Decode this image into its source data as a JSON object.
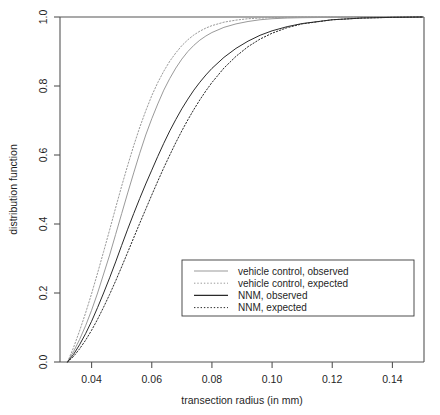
{
  "chart_data": {
    "type": "line",
    "title": "",
    "xlabel": "transection radius (in mm)",
    "ylabel": "distribution function",
    "xlim": [
      0.0295,
      0.1505
    ],
    "ylim": [
      0.0,
      1.0
    ],
    "xticks": [
      0.04,
      0.06,
      0.08,
      0.1,
      0.12,
      0.14
    ],
    "xtick_labels": [
      "0.04",
      "0.06",
      "0.08",
      "0.10",
      "0.12",
      "0.14"
    ],
    "yticks": [
      0.0,
      0.2,
      0.4,
      0.6,
      0.8,
      1.0
    ],
    "ytick_labels": [
      "0.0",
      "0.2",
      "0.4",
      "0.6",
      "0.8",
      "1.0"
    ],
    "grid": false,
    "legend_position": "center-right-lower",
    "colors": {
      "vehicle_control": "#9a9a9a",
      "nnm": "#2a2a2a"
    },
    "series": [
      {
        "name": "vehicle control, observed",
        "color": "#9a9a9a",
        "linestyle": "solid",
        "x": [
          0.032,
          0.034,
          0.036,
          0.038,
          0.04,
          0.042,
          0.044,
          0.046,
          0.048,
          0.05,
          0.052,
          0.054,
          0.056,
          0.058,
          0.06,
          0.062,
          0.064,
          0.066,
          0.068,
          0.07,
          0.072,
          0.074,
          0.076,
          0.078,
          0.08,
          0.084,
          0.088,
          0.092,
          0.096,
          0.1,
          0.105,
          0.11,
          0.12,
          0.13,
          0.14,
          0.15
        ],
        "y": [
          0.0,
          0.03,
          0.065,
          0.105,
          0.15,
          0.2,
          0.255,
          0.31,
          0.37,
          0.43,
          0.49,
          0.548,
          0.605,
          0.658,
          0.705,
          0.748,
          0.788,
          0.822,
          0.852,
          0.878,
          0.9,
          0.918,
          0.933,
          0.945,
          0.955,
          0.97,
          0.98,
          0.987,
          0.992,
          0.995,
          0.997,
          0.998,
          0.999,
          1.0,
          1.0,
          1.0
        ]
      },
      {
        "name": "vehicle control, expected",
        "color": "#9a9a9a",
        "linestyle": "dotted",
        "x": [
          0.032,
          0.034,
          0.036,
          0.038,
          0.04,
          0.042,
          0.044,
          0.046,
          0.048,
          0.05,
          0.052,
          0.054,
          0.056,
          0.058,
          0.06,
          0.062,
          0.064,
          0.066,
          0.068,
          0.07,
          0.072,
          0.074,
          0.076,
          0.078,
          0.08,
          0.084,
          0.088,
          0.092,
          0.096,
          0.1,
          0.105,
          0.11,
          0.12,
          0.13,
          0.14,
          0.15
        ],
        "y": [
          0.0,
          0.042,
          0.09,
          0.142,
          0.198,
          0.258,
          0.32,
          0.383,
          0.447,
          0.51,
          0.57,
          0.627,
          0.68,
          0.728,
          0.772,
          0.81,
          0.843,
          0.872,
          0.896,
          0.917,
          0.934,
          0.948,
          0.959,
          0.968,
          0.975,
          0.985,
          0.991,
          0.995,
          0.997,
          0.998,
          0.999,
          1.0,
          1.0,
          1.0,
          1.0,
          1.0
        ]
      },
      {
        "name": "NNM, observed",
        "color": "#2a2a2a",
        "linestyle": "solid",
        "x": [
          0.032,
          0.034,
          0.036,
          0.038,
          0.04,
          0.042,
          0.044,
          0.046,
          0.048,
          0.05,
          0.052,
          0.054,
          0.056,
          0.058,
          0.06,
          0.062,
          0.064,
          0.066,
          0.068,
          0.07,
          0.072,
          0.074,
          0.076,
          0.078,
          0.08,
          0.084,
          0.088,
          0.092,
          0.096,
          0.1,
          0.105,
          0.11,
          0.12,
          0.13,
          0.14,
          0.15
        ],
        "y": [
          0.0,
          0.022,
          0.05,
          0.082,
          0.118,
          0.158,
          0.2,
          0.244,
          0.29,
          0.338,
          0.385,
          0.43,
          0.474,
          0.516,
          0.556,
          0.596,
          0.634,
          0.67,
          0.703,
          0.734,
          0.762,
          0.788,
          0.811,
          0.832,
          0.851,
          0.883,
          0.909,
          0.93,
          0.947,
          0.96,
          0.972,
          0.981,
          0.992,
          0.997,
          0.999,
          1.0
        ]
      },
      {
        "name": "NNM, expected",
        "color": "#2a2a2a",
        "linestyle": "dotted",
        "x": [
          0.032,
          0.034,
          0.036,
          0.038,
          0.04,
          0.042,
          0.044,
          0.046,
          0.048,
          0.05,
          0.052,
          0.054,
          0.056,
          0.058,
          0.06,
          0.062,
          0.064,
          0.066,
          0.068,
          0.07,
          0.072,
          0.074,
          0.076,
          0.078,
          0.08,
          0.084,
          0.088,
          0.092,
          0.096,
          0.1,
          0.105,
          0.11,
          0.12,
          0.13,
          0.14,
          0.15
        ],
        "y": [
          0.0,
          0.016,
          0.038,
          0.063,
          0.092,
          0.124,
          0.159,
          0.196,
          0.235,
          0.276,
          0.318,
          0.36,
          0.402,
          0.443,
          0.484,
          0.524,
          0.563,
          0.6,
          0.636,
          0.67,
          0.702,
          0.732,
          0.76,
          0.786,
          0.81,
          0.852,
          0.886,
          0.914,
          0.936,
          0.953,
          0.969,
          0.98,
          0.992,
          0.997,
          0.999,
          1.0
        ]
      }
    ]
  },
  "legend": {
    "entries": [
      {
        "label": "vehicle control, observed"
      },
      {
        "label": "vehicle control, expected"
      },
      {
        "label": "NNM, observed"
      },
      {
        "label": "NNM, expected"
      }
    ]
  }
}
